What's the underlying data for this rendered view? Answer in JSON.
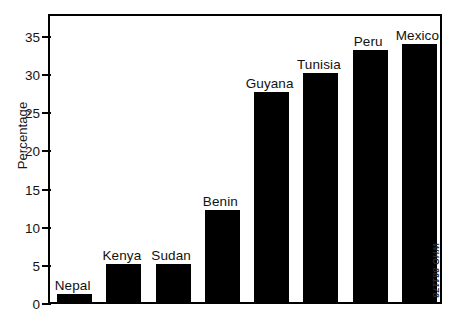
{
  "chart_data": {
    "type": "bar",
    "title": "",
    "subtitle": "",
    "xlabel": "",
    "ylabel": "Percentage",
    "categories": [
      "Nepal",
      "Kenya",
      "Sudan",
      "Benin",
      "Guyana",
      "Tunisia",
      "Peru",
      "Mexico"
    ],
    "values": [
      1,
      5,
      5,
      12,
      27.5,
      30,
      33,
      33.8
    ],
    "ylim": [
      0,
      38
    ],
    "yticks": [
      0,
      5,
      10,
      15,
      20,
      25,
      30,
      35
    ],
    "ytick_labels": [
      "0",
      "5",
      "10",
      "15",
      "20",
      "25",
      "30",
      "35"
    ],
    "xtick_labels": [],
    "grid": false,
    "legend": null,
    "bar_color": "#000000",
    "background_color": "#ffffff",
    "axis_color": "#000000",
    "annotations": [
      {
        "name": "who-credit",
        "text": "WHO 881178",
        "rotation": 90,
        "position": "right-margin"
      }
    ]
  }
}
